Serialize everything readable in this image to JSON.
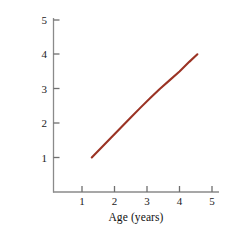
{
  "chart_data": {
    "type": "line",
    "title": "",
    "subtitle": "",
    "xlabel": "Age (years)",
    "ylabel": "Memory Span",
    "xlim": [
      0.0,
      5.4
    ],
    "ylim": [
      0.0,
      5.45
    ],
    "xticks": [
      1,
      2,
      3,
      4,
      5
    ],
    "xtick_labels": [
      "1",
      "2",
      "3",
      "4",
      "5"
    ],
    "yticks": [
      1,
      2,
      3,
      4,
      5
    ],
    "ytick_labels": [
      "1",
      "2",
      "3",
      "4",
      "5"
    ],
    "grid": false,
    "legend": null,
    "legend_position": "none",
    "annotations": [],
    "series": [
      {
        "name": "Memory span vs age",
        "color": "#9b3324",
        "line_width": 2.1,
        "marker": "none",
        "x": [
          1.3,
          1.6,
          1.9,
          2.2,
          2.5,
          2.8,
          3.1,
          3.4,
          3.7,
          4.0,
          4.3,
          4.55
        ],
        "y": [
          1.0,
          1.29,
          1.58,
          1.87,
          2.16,
          2.45,
          2.73,
          3.0,
          3.25,
          3.5,
          3.78,
          4.0
        ]
      }
    ]
  },
  "axes": {
    "line_color": "#8a8a8a",
    "tick_color": "#6f6f6f"
  },
  "text": {
    "xlabel": "Age (years)",
    "ylabel": "Memory Span",
    "x_tick_1": "1",
    "x_tick_2": "2",
    "x_tick_3": "3",
    "x_tick_4": "4",
    "x_tick_5": "5",
    "y_tick_1": "1",
    "y_tick_2": "2",
    "y_tick_3": "3",
    "y_tick_4": "4",
    "y_tick_5": "5"
  }
}
